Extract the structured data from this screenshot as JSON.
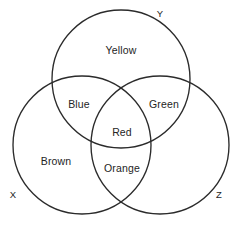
{
  "figure": {
    "type": "venn-diagram",
    "background_color": "#ffffff",
    "stroke_color": "#2b2b2b",
    "text_color": "#242424",
    "width": 241,
    "height": 231
  },
  "sets": [
    {
      "id": "Y",
      "label": "Y",
      "label_x": 160,
      "label_y": 13,
      "center_x": 121,
      "center_y": 79,
      "radius": 69
    },
    {
      "id": "X",
      "label": "X",
      "label_x": 13,
      "label_y": 194,
      "center_x": 82,
      "center_y": 145,
      "radius": 69
    },
    {
      "id": "Z",
      "label": "Z",
      "label_x": 219,
      "label_y": 194,
      "center_x": 160,
      "center_y": 145,
      "radius": 69
    }
  ],
  "regions": [
    {
      "id": "yellow",
      "label": "Yellow",
      "belongs_to": "Y",
      "x": 121,
      "y": 50
    },
    {
      "id": "blue",
      "label": "Blue",
      "belongs_to": "X and Y",
      "x": 79,
      "y": 104
    },
    {
      "id": "green",
      "label": "Green",
      "belongs_to": "Y and Z",
      "x": 164,
      "y": 104
    },
    {
      "id": "red",
      "label": "Red",
      "belongs_to": "X and Y and Z",
      "x": 122,
      "y": 132
    },
    {
      "id": "brown",
      "label": "Brown",
      "belongs_to": "X",
      "x": 56,
      "y": 161
    },
    {
      "id": "orange",
      "label": "Orange",
      "belongs_to": "X and Z",
      "x": 122,
      "y": 168
    }
  ]
}
